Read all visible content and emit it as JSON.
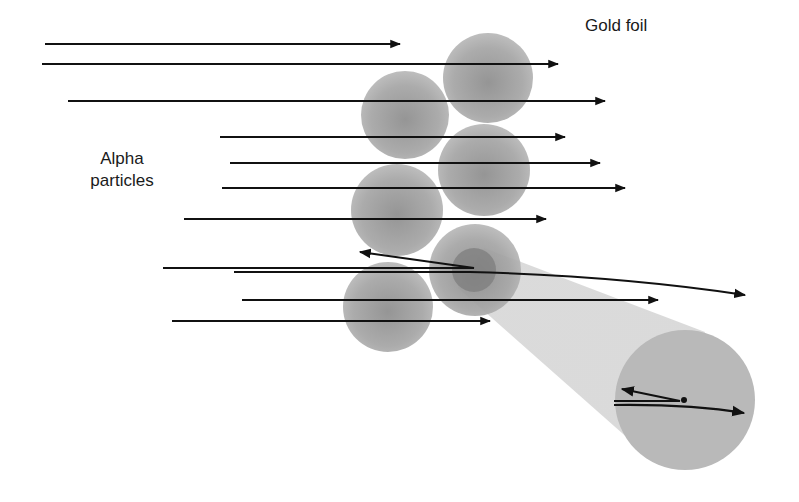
{
  "diagram": {
    "labels": {
      "gold_foil": "Gold foil",
      "alpha_line1": "Alpha",
      "alpha_line2": "particles"
    },
    "colors": {
      "background": "#ffffff",
      "atom_fill": "#9a9a9a",
      "nucleus_fill": "#7d7d7d",
      "beam_fill": "#c8c8c8",
      "arrow": "#111111"
    },
    "atoms": [
      {
        "cx": 488,
        "cy": 78,
        "r": 45
      },
      {
        "cx": 405,
        "cy": 115,
        "r": 44
      },
      {
        "cx": 484,
        "cy": 170,
        "r": 46
      },
      {
        "cx": 397,
        "cy": 210,
        "r": 46
      },
      {
        "cx": 475,
        "cy": 270,
        "r": 46
      },
      {
        "cx": 388,
        "cy": 307,
        "r": 45
      }
    ],
    "highlighted_nucleus": {
      "cx": 474,
      "cy": 270,
      "r": 22
    },
    "zoom_circle": {
      "cx": 685,
      "cy": 400,
      "r": 70
    },
    "arrows": [
      {
        "x1": 45,
        "y1": 44,
        "x2": 400,
        "y2": 44
      },
      {
        "x1": 42,
        "y1": 64,
        "x2": 558,
        "y2": 64
      },
      {
        "x1": 68,
        "y1": 101,
        "x2": 605,
        "y2": 101
      },
      {
        "x1": 220,
        "y1": 137,
        "x2": 565,
        "y2": 137
      },
      {
        "x1": 230,
        "y1": 163,
        "x2": 600,
        "y2": 163
      },
      {
        "x1": 222,
        "y1": 188,
        "x2": 625,
        "y2": 188
      },
      {
        "x1": 184,
        "y1": 219,
        "x2": 546,
        "y2": 219
      },
      {
        "x1": 242,
        "y1": 300,
        "x2": 658,
        "y2": 300
      },
      {
        "x1": 172,
        "y1": 321,
        "x2": 490,
        "y2": 321
      }
    ],
    "deflected_paths": {
      "backscatter": {
        "start_x": 163,
        "start_y": 268,
        "turn_x": 474,
        "turn_y": 268,
        "end_x": 360,
        "end_y": 252
      },
      "slight_deflection": {
        "start_x": 234,
        "start_y": 272,
        "end_x": 745,
        "end_y": 295
      }
    },
    "zoom_paths": {
      "nucleus_dot": {
        "cx": 684,
        "cy": 400,
        "r": 3
      },
      "backscatter": {
        "start_x": 614,
        "start_y": 401,
        "turn_x": 680,
        "turn_y": 401,
        "end_x": 622,
        "end_y": 389
      },
      "deflection": {
        "start_x": 614,
        "start_y": 405,
        "end_x": 744,
        "end_y": 413
      }
    }
  }
}
